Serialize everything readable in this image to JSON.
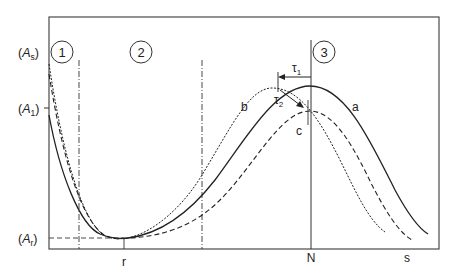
{
  "figure": {
    "y_axis_labels": {
      "A_s": {
        "base": "A",
        "sub": "s"
      },
      "A_1": {
        "base": "A",
        "sub": "1"
      },
      "A_r": {
        "base": "A",
        "sub": "r"
      }
    },
    "x_axis_labels": {
      "r": "r",
      "N": "N",
      "s": "s"
    },
    "region_markers": [
      "1",
      "2",
      "3"
    ],
    "curve_labels": {
      "a": "a",
      "b": "b",
      "c": "c"
    },
    "delay_labels": {
      "tau1": {
        "base": "τ",
        "sub": "1"
      },
      "tau2": {
        "base": "τ",
        "sub": "2"
      }
    },
    "curves": [
      {
        "id": "a",
        "style": "solid",
        "description": "reference response, peak at N"
      },
      {
        "id": "b",
        "style": "dotted",
        "description": "response shifted earlier by τ1"
      },
      {
        "id": "c",
        "style": "dashed",
        "description": "attenuated response, peak at N"
      }
    ],
    "colors": {
      "line": "#2a2a2a",
      "frame": "#4a4a4a",
      "background": "#ffffff"
    }
  }
}
